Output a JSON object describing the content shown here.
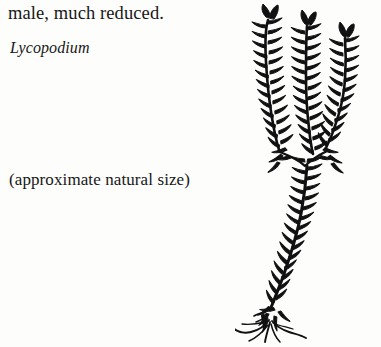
{
  "page": {
    "background_color": "#fdfdfc",
    "ink_color": "#171717",
    "width": 381,
    "height": 347
  },
  "caption": {
    "line_male": "male, much reduced.",
    "line_genus": "Lycopodium",
    "line_size": "(approximate natural size)"
  },
  "figure": {
    "name": "lycopodium-illustration",
    "style": "pen-and-ink line engraving",
    "ink_color": "#111111",
    "parts": [
      {
        "name": "strobilus-left",
        "label": "left cone"
      },
      {
        "name": "strobilus-middle",
        "label": "middle cone"
      },
      {
        "name": "strobilus-right",
        "label": "right cone"
      },
      {
        "name": "main-stem",
        "label": "scaly creeping stem"
      },
      {
        "name": "roots",
        "label": "fibrous roots"
      }
    ]
  }
}
